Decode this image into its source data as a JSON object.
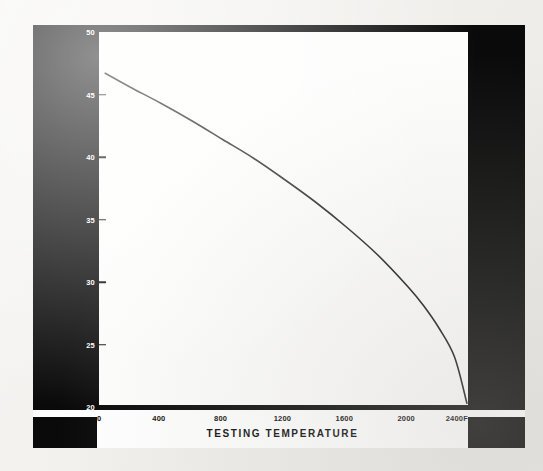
{
  "figure": {
    "panel_background": "#fdfdfc",
    "band_color": "#0a0a0a",
    "paper_color": "#f4f3f1",
    "curve_color": "#1a1a1a"
  },
  "chart_data": {
    "type": "line",
    "title": "",
    "xlabel": "TESTING TEMPERATURE",
    "ylabel": "STATIC MODULUS OF ELASTICITY—1,000,000 psi",
    "xlim": [
      0,
      2400
    ],
    "ylim": [
      20,
      50
    ],
    "xticks": [
      0,
      400,
      800,
      1200,
      1600,
      2000,
      2400
    ],
    "xtick_labels": [
      "0",
      "400",
      "800",
      "1200",
      "1600",
      "2000",
      "2400F"
    ],
    "yticks": [
      20,
      25,
      30,
      35,
      40,
      45,
      50
    ],
    "ytick_labels": [
      "20",
      "25",
      "30",
      "35",
      "40",
      "45",
      "50"
    ],
    "grid": false,
    "legend": null,
    "series": [
      {
        "name": "Static modulus of elasticity",
        "x": [
          40,
          200,
          400,
          600,
          800,
          1000,
          1200,
          1400,
          1600,
          1800,
          2000,
          2100,
          2200,
          2300,
          2380
        ],
        "values": [
          46.7,
          45.6,
          44.3,
          42.9,
          41.4,
          39.9,
          38.2,
          36.4,
          34.4,
          32.2,
          29.6,
          28.1,
          26.3,
          24.0,
          20.3
        ]
      }
    ],
    "annotations": []
  }
}
